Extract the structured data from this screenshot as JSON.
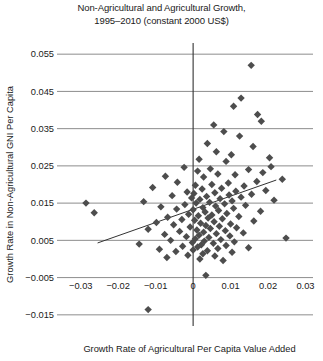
{
  "chart_data": {
    "type": "scatter",
    "title": "Non-Agricultural and Agricultural Growth, 1995–2010 (constant 2000 US$)",
    "title_line1": "Non-Agricultural and Agricultural Growth,",
    "title_line2": "1995–2010 (constant 2000 US$)",
    "xlabel": "Growth Rate of Agricultural Per Capita Value Added",
    "ylabel": "Growth Rate in Non-Agricultural GNI Per Capita",
    "xlim": [
      -0.035,
      0.032
    ],
    "ylim": [
      -0.018,
      0.058
    ],
    "xticks": [
      -0.03,
      -0.02,
      -0.01,
      0,
      0.01,
      0.02,
      0.03
    ],
    "xticklabels": [
      "−0.03",
      "−0.02",
      "−0.01",
      "0",
      "0.01",
      "0.02",
      "0.03"
    ],
    "yticks": [
      -0.015,
      -0.005,
      0.005,
      0.015,
      0.025,
      0.035,
      0.045,
      0.055
    ],
    "yticklabels": [
      "−0.015",
      "−0.005",
      "0.005",
      "0.015",
      "0.025",
      "0.035",
      "0.045",
      "0.055"
    ],
    "grid": "horizontal",
    "grid_color": "#808080",
    "marker": "diamond",
    "marker_color": "#4d4d4d",
    "marker_size": 5,
    "legend": null,
    "trendline": {
      "x": [
        -0.0255,
        0.0222
      ],
      "y": [
        0.0043,
        0.0212
      ],
      "color": "#333333"
    },
    "axis_lines": {
      "vertical_at_x": 0,
      "horizontal_at_y": null,
      "color": "#333333"
    },
    "points": [
      [
        0.0155,
        0.052
      ],
      [
        0.0128,
        0.0432
      ],
      [
        0.0108,
        0.041
      ],
      [
        0.0172,
        0.0388
      ],
      [
        0.0182,
        0.037
      ],
      [
        0.0055,
        0.036
      ],
      [
        0.0082,
        0.0342
      ],
      [
        0.0124,
        0.033
      ],
      [
        0.0038,
        0.031
      ],
      [
        0.016,
        0.0302
      ],
      [
        0.0062,
        0.0288
      ],
      [
        0.0102,
        0.028
      ],
      [
        0.0204,
        0.0272
      ],
      [
        0.0016,
        0.0268
      ],
      [
        0.0088,
        0.0262
      ],
      [
        0.0208,
        0.0248
      ],
      [
        -0.0024,
        0.0246
      ],
      [
        0.0046,
        0.0242
      ],
      [
        0.0148,
        0.024
      ],
      [
        0.0012,
        0.0236
      ],
      [
        0.0186,
        0.0232
      ],
      [
        0.0066,
        0.0228
      ],
      [
        0.0112,
        0.0226
      ],
      [
        -0.0074,
        0.0222
      ],
      [
        0.0028,
        0.022
      ],
      [
        0.0238,
        0.0214
      ],
      [
        0.017,
        0.0208
      ],
      [
        -0.0042,
        0.0206
      ],
      [
        0.0094,
        0.0204
      ],
      [
        0.005,
        0.02
      ],
      [
        0.0006,
        0.0198
      ],
      [
        0.0136,
        0.0196
      ],
      [
        -0.0108,
        0.0192
      ],
      [
        0.0076,
        0.019
      ],
      [
        0.0024,
        0.0188
      ],
      [
        0.0194,
        0.0184
      ],
      [
        0.0114,
        0.0182
      ],
      [
        -0.0016,
        0.018
      ],
      [
        0.0058,
        0.0178
      ],
      [
        0.0002,
        0.0176
      ],
      [
        0.0156,
        0.0174
      ],
      [
        0.0096,
        0.0172
      ],
      [
        -0.0056,
        0.017
      ],
      [
        0.0036,
        0.0168
      ],
      [
        0.0128,
        0.0166
      ],
      [
        -0.0004,
        0.0164
      ],
      [
        0.0072,
        0.0162
      ],
      [
        0.0018,
        0.016
      ],
      [
        0.0216,
        0.0158
      ],
      [
        0.0104,
        0.0156
      ],
      [
        -0.0132,
        0.0154
      ],
      [
        0.0044,
        0.0152
      ],
      [
        -0.0286,
        0.015
      ],
      [
        0.0008,
        0.015
      ],
      [
        0.0084,
        0.0148
      ],
      [
        -0.0022,
        0.0146
      ],
      [
        0.014,
        0.0144
      ],
      [
        0.006,
        0.0142
      ],
      [
        -0.0086,
        0.014
      ],
      [
        0.0026,
        0.0138
      ],
      [
        0.0108,
        0.0136
      ],
      [
        -0.0044,
        0.0134
      ],
      [
        0.0,
        0.0132
      ],
      [
        0.0068,
        0.013
      ],
      [
        0.018,
        0.0128
      ],
      [
        0.0032,
        0.0126
      ],
      [
        -0.0264,
        0.0124
      ],
      [
        0.009,
        0.0122
      ],
      [
        -0.0012,
        0.012
      ],
      [
        0.005,
        0.0118
      ],
      [
        0.0014,
        0.0116
      ],
      [
        0.0122,
        0.0114
      ],
      [
        -0.0068,
        0.0112
      ],
      [
        0.004,
        0.011
      ],
      [
        0.0078,
        0.0108
      ],
      [
        -0.003,
        0.0106
      ],
      [
        0.0004,
        0.0104
      ],
      [
        0.0162,
        0.0102
      ],
      [
        0.0056,
        0.01
      ],
      [
        -0.0098,
        0.0098
      ],
      [
        0.002,
        0.0096
      ],
      [
        0.01,
        0.0094
      ],
      [
        -0.0052,
        0.0092
      ],
      [
        0.0034,
        0.009
      ],
      [
        0.007,
        0.0088
      ],
      [
        -0.0008,
        0.0086
      ],
      [
        0.0116,
        0.0084
      ],
      [
        0.0046,
        0.0082
      ],
      [
        -0.012,
        0.008
      ],
      [
        0.001,
        0.0078
      ],
      [
        0.0086,
        0.0076
      ],
      [
        -0.0036,
        0.0074
      ],
      [
        0.0028,
        0.0072
      ],
      [
        0.0134,
        0.007
      ],
      [
        0.0062,
        0.0068
      ],
      [
        -0.0076,
        0.0066
      ],
      [
        0.0016,
        0.0064
      ],
      [
        0.0098,
        0.0062
      ],
      [
        -0.0018,
        0.006
      ],
      [
        0.0042,
        0.0058
      ],
      [
        0.0248,
        0.0056
      ],
      [
        0.0006,
        0.0054
      ],
      [
        0.0074,
        0.0052
      ],
      [
        -0.006,
        0.005
      ],
      [
        0.003,
        0.0048
      ],
      [
        0.011,
        0.0046
      ],
      [
        -0.0002,
        0.0044
      ],
      [
        0.0054,
        0.0042
      ],
      [
        -0.0144,
        0.004
      ],
      [
        0.0022,
        0.0038
      ],
      [
        0.0088,
        0.0036
      ],
      [
        -0.0028,
        0.0034
      ],
      [
        0.0012,
        0.0032
      ],
      [
        0.0148,
        0.003
      ],
      [
        0.0066,
        0.0028
      ],
      [
        -0.009,
        0.0026
      ],
      [
        0.0,
        0.0024
      ],
      [
        0.0038,
        0.0022
      ],
      [
        -0.0046,
        0.002
      ],
      [
        0.0104,
        0.0018
      ],
      [
        0.0026,
        0.0014
      ],
      [
        -0.0014,
        0.001
      ],
      [
        0.0058,
        0.0008
      ],
      [
        -0.007,
        0.0004
      ],
      [
        0.0018,
        0.0
      ],
      [
        0.008,
        -0.0004
      ],
      [
        0.0034,
        -0.0044
      ],
      [
        -0.012,
        -0.0136
      ]
    ]
  }
}
